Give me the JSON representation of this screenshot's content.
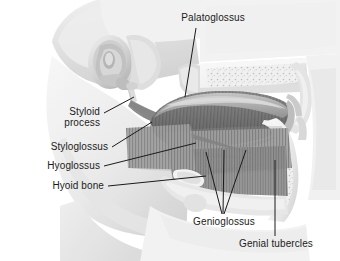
{
  "figure": {
    "width": 340,
    "height": 261,
    "background_color": "#ffffff",
    "style": "grayscale medical illustration, sagittal section of head showing extrinsic tongue muscles",
    "label_text_color": "#1b1b1b",
    "leader_line_color": "#1a1a1a"
  },
  "labels": {
    "palatoglossus": "Palatoglossus",
    "styloid_process_line1": "Styloid",
    "styloid_process_line2": "process",
    "styloglossus": "Styloglossus",
    "hyoglossus": "Hyoglossus",
    "hyoid_bone": "Hyoid bone",
    "genioglossus": "Genioglossus",
    "genial_tubercles": "Genial tubercles"
  },
  "anatomy": {
    "regions": [
      "external ear and temporal bone",
      "styloid process",
      "mandible",
      "hard palate",
      "soft palate and uvula",
      "tongue body with intrinsic muscle striations",
      "floor of mouth musculature",
      "hyoid bone",
      "neck soft tissue"
    ]
  }
}
